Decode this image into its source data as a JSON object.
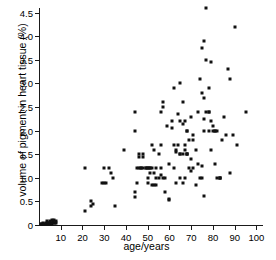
{
  "chart_data": {
    "type": "scatter",
    "title": "",
    "xlabel": "age/years",
    "ylabel": "volume of pigment in heart tissue (%)",
    "xlim": [
      0,
      103
    ],
    "ylim": [
      0,
      4.6
    ],
    "xticks": [
      10,
      20,
      30,
      40,
      50,
      60,
      70,
      80,
      90,
      100
    ],
    "xticklabels": [
      "10",
      "20",
      "30",
      "40",
      "50",
      "60",
      "70",
      "80",
      "90",
      "100"
    ],
    "yticks": [
      0,
      0.5,
      1.0,
      1.5,
      2.0,
      2.5,
      3.0,
      3.5,
      4.0,
      4.5
    ],
    "yticklabels": [
      "0",
      "0.5",
      "1.0",
      "1.5",
      "2.0",
      "2.5",
      "3.0",
      "3.5",
      "4.0",
      "4.5"
    ],
    "grid": false,
    "legend": false,
    "marker": "square",
    "marker_color": "#111111",
    "series": [
      {
        "name": "pigment vs age",
        "points": [
          [
            1,
            0.02
          ],
          [
            1,
            0.02
          ],
          [
            2,
            0.02
          ],
          [
            2,
            0.05
          ],
          [
            2.5,
            0.02
          ],
          [
            3,
            0.05
          ],
          [
            3,
            0.02
          ],
          [
            3.5,
            0.08
          ],
          [
            4,
            0.05
          ],
          [
            4,
            0.02
          ],
          [
            4.5,
            0.05
          ],
          [
            5,
            0.08
          ],
          [
            5,
            0.05
          ],
          [
            5,
            0.02
          ],
          [
            5.5,
            0.05
          ],
          [
            6,
            0.1
          ],
          [
            6,
            0.05
          ],
          [
            6,
            0.02
          ],
          [
            6.5,
            0.08
          ],
          [
            7,
            0.1
          ],
          [
            7,
            0.05
          ],
          [
            7.5,
            0.05
          ],
          [
            8,
            0.08
          ],
          [
            8,
            0.05
          ],
          [
            21,
            0.3
          ],
          [
            21,
            1.2
          ],
          [
            24,
            0.5
          ],
          [
            24,
            0.4
          ],
          [
            25,
            0.45
          ],
          [
            29,
            0.9
          ],
          [
            30,
            1.2
          ],
          [
            30,
            0.9
          ],
          [
            31,
            0.9
          ],
          [
            32,
            1.2
          ],
          [
            33,
            1.1
          ],
          [
            34,
            1.0
          ],
          [
            35,
            0.4
          ],
          [
            39,
            1.6
          ],
          [
            44,
            2.0
          ],
          [
            44,
            2.4
          ],
          [
            44,
            0.7
          ],
          [
            44,
            0.6
          ],
          [
            45,
            1.2
          ],
          [
            45,
            0.9
          ],
          [
            46,
            1.2
          ],
          [
            46,
            1.5
          ],
          [
            46,
            1.45
          ],
          [
            47,
            1.2
          ],
          [
            47,
            1.2
          ],
          [
            48,
            1.5
          ],
          [
            48,
            1.45
          ],
          [
            48,
            1.2
          ],
          [
            49,
            1.2
          ],
          [
            49,
            1.2
          ],
          [
            50,
            1.2
          ],
          [
            50,
            1.2
          ],
          [
            50,
            1.0
          ],
          [
            50,
            0.9
          ],
          [
            51,
            1.2
          ],
          [
            51,
            1.2
          ],
          [
            51,
            1.1
          ],
          [
            52,
            1.7
          ],
          [
            52,
            1.2
          ],
          [
            52,
            0.85
          ],
          [
            53,
            1.6
          ],
          [
            53,
            1.1
          ],
          [
            53,
            0.85
          ],
          [
            54,
            1.2
          ],
          [
            54,
            1.0
          ],
          [
            54,
            0.85
          ],
          [
            55,
            1.5
          ],
          [
            55,
            1.0
          ],
          [
            56,
            2.4
          ],
          [
            56,
            1.7
          ],
          [
            56,
            1.2
          ],
          [
            56,
            1.05
          ],
          [
            57,
            2.6
          ],
          [
            57,
            2.5
          ],
          [
            57,
            1.0
          ],
          [
            58,
            1.0
          ],
          [
            58,
            0.7
          ],
          [
            59,
            2.1
          ],
          [
            60,
            1.3
          ],
          [
            60,
            0.55
          ],
          [
            60,
            0.52
          ],
          [
            61,
            2.2
          ],
          [
            61,
            2.05
          ],
          [
            62,
            2.9
          ],
          [
            62,
            1.7
          ],
          [
            62,
            1.2
          ],
          [
            63,
            1.6
          ],
          [
            63,
            1.55
          ],
          [
            63,
            0.9
          ],
          [
            64,
            2.35
          ],
          [
            64,
            1.7
          ],
          [
            65,
            3.0
          ],
          [
            65,
            2.2
          ],
          [
            65,
            1.5
          ],
          [
            65,
            1.5
          ],
          [
            65,
            1.0
          ],
          [
            66,
            2.6
          ],
          [
            66,
            2.15
          ],
          [
            66,
            1.5
          ],
          [
            66,
            0.9
          ],
          [
            67,
            2.2
          ],
          [
            67,
            1.7
          ],
          [
            67,
            1.6
          ],
          [
            67,
            1.0
          ],
          [
            68,
            2.0
          ],
          [
            68,
            2.0
          ],
          [
            68,
            1.5
          ],
          [
            68,
            1.5
          ],
          [
            68,
            1.5
          ],
          [
            69,
            1.8
          ],
          [
            69,
            1.2
          ],
          [
            70,
            2.3
          ],
          [
            70,
            1.4
          ],
          [
            70,
            1.15
          ],
          [
            71,
            1.9
          ],
          [
            71,
            1.8
          ],
          [
            71,
            1.2
          ],
          [
            72,
            1.6
          ],
          [
            72,
            0.85
          ],
          [
            73,
            2.4
          ],
          [
            73,
            1.3
          ],
          [
            74,
            3.1
          ],
          [
            74,
            1.0
          ],
          [
            75,
            3.75
          ],
          [
            75,
            2.8
          ],
          [
            75,
            1.25
          ],
          [
            75,
            1.0
          ],
          [
            76,
            3.9
          ],
          [
            76,
            2.7
          ],
          [
            76,
            2.25
          ],
          [
            76,
            2.0
          ],
          [
            76,
            0.62
          ],
          [
            77,
            4.6
          ],
          [
            77,
            3.5
          ],
          [
            77,
            2.4
          ],
          [
            78,
            2.9
          ],
          [
            78,
            2.4
          ],
          [
            78,
            2.4
          ],
          [
            78,
            2.0
          ],
          [
            79,
            3.45
          ],
          [
            79,
            2.2
          ],
          [
            79,
            1.6
          ],
          [
            80,
            2.1
          ],
          [
            80,
            2.0
          ],
          [
            81,
            2.0
          ],
          [
            81,
            2.0
          ],
          [
            81,
            1.3
          ],
          [
            82,
            2.0
          ],
          [
            82,
            1.0
          ],
          [
            83,
            1.0
          ],
          [
            83,
            1.0
          ],
          [
            83,
            1.0
          ],
          [
            84,
            1.8
          ],
          [
            85,
            2.3
          ],
          [
            86,
            1.9
          ],
          [
            87,
            3.3
          ],
          [
            88,
            3.1
          ],
          [
            88,
            1.1
          ],
          [
            89,
            1.9
          ],
          [
            90,
            4.2
          ],
          [
            91,
            1.7
          ],
          [
            95,
            2.4
          ]
        ]
      }
    ]
  }
}
